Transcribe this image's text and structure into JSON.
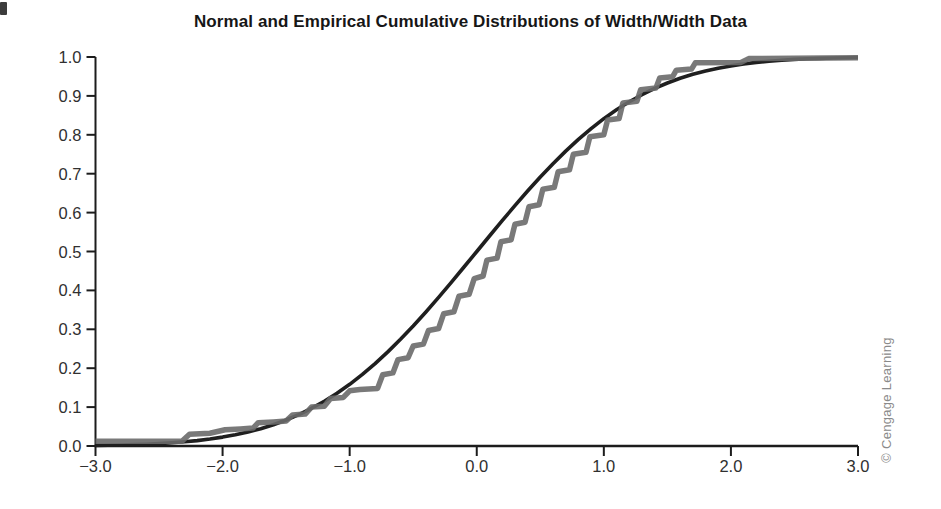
{
  "credit": {
    "text": "© Cengage Learning"
  },
  "colors": {
    "background": "#ffffff",
    "axis": "#1c1c1c",
    "tick_label": "#303030",
    "title": "#161616",
    "credit": "#8a8a8a",
    "normal_curve": "#1f1f1f",
    "empirical_curve": "#6a6a6a"
  },
  "chart_data": {
    "type": "line",
    "title": "Normal and Empirical Cumulative Distributions of Width/Width Data",
    "xlabel": "",
    "ylabel": "",
    "xlim": [
      -3.0,
      3.0
    ],
    "ylim": [
      0.0,
      1.0
    ],
    "grid": false,
    "legend_position": "none",
    "x_ticks": [
      {
        "value": -3.0,
        "label": "−3.0"
      },
      {
        "value": -2.0,
        "label": "−2.0"
      },
      {
        "value": -1.0,
        "label": "−1.0"
      },
      {
        "value": 0.0,
        "label": "0.0"
      },
      {
        "value": 1.0,
        "label": "1.0"
      },
      {
        "value": 2.0,
        "label": "2.0"
      },
      {
        "value": 3.0,
        "label": "3.0"
      }
    ],
    "y_ticks": [
      {
        "value": 0.0,
        "label": "0.0"
      },
      {
        "value": 0.1,
        "label": "0.1"
      },
      {
        "value": 0.2,
        "label": "0.2"
      },
      {
        "value": 0.3,
        "label": "0.3"
      },
      {
        "value": 0.4,
        "label": "0.4"
      },
      {
        "value": 0.5,
        "label": "0.5"
      },
      {
        "value": 0.6,
        "label": "0.6"
      },
      {
        "value": 0.7,
        "label": "0.7"
      },
      {
        "value": 0.8,
        "label": "0.8"
      },
      {
        "value": 0.9,
        "label": "0.9"
      },
      {
        "value": 1.0,
        "label": "1.0"
      }
    ],
    "series": [
      {
        "name": "normal-cdf",
        "label": "Normal cumulative distribution",
        "color": "#1f1f1f",
        "stroke_width": 3.6,
        "points": [
          [
            -3.0,
            0.0013
          ],
          [
            -2.9,
            0.0019
          ],
          [
            -2.8,
            0.0026
          ],
          [
            -2.7,
            0.0035
          ],
          [
            -2.6,
            0.0047
          ],
          [
            -2.5,
            0.0062
          ],
          [
            -2.4,
            0.0082
          ],
          [
            -2.3,
            0.0107
          ],
          [
            -2.2,
            0.0139
          ],
          [
            -2.1,
            0.0179
          ],
          [
            -2.0,
            0.0228
          ],
          [
            -1.9,
            0.0287
          ],
          [
            -1.8,
            0.0359
          ],
          [
            -1.7,
            0.0446
          ],
          [
            -1.6,
            0.0548
          ],
          [
            -1.5,
            0.0668
          ],
          [
            -1.4,
            0.0808
          ],
          [
            -1.3,
            0.0968
          ],
          [
            -1.2,
            0.1151
          ],
          [
            -1.1,
            0.1357
          ],
          [
            -1.0,
            0.1587
          ],
          [
            -0.9,
            0.1841
          ],
          [
            -0.8,
            0.2119
          ],
          [
            -0.7,
            0.242
          ],
          [
            -0.6,
            0.2743
          ],
          [
            -0.5,
            0.3085
          ],
          [
            -0.4,
            0.3446
          ],
          [
            -0.3,
            0.3821
          ],
          [
            -0.2,
            0.4207
          ],
          [
            -0.1,
            0.4602
          ],
          [
            0.0,
            0.5
          ],
          [
            0.1,
            0.5398
          ],
          [
            0.2,
            0.5793
          ],
          [
            0.3,
            0.6179
          ],
          [
            0.4,
            0.6554
          ],
          [
            0.5,
            0.6915
          ],
          [
            0.6,
            0.7257
          ],
          [
            0.7,
            0.758
          ],
          [
            0.8,
            0.7881
          ],
          [
            0.9,
            0.8159
          ],
          [
            1.0,
            0.8413
          ],
          [
            1.1,
            0.8643
          ],
          [
            1.2,
            0.8849
          ],
          [
            1.3,
            0.9032
          ],
          [
            1.4,
            0.9192
          ],
          [
            1.5,
            0.9332
          ],
          [
            1.6,
            0.9452
          ],
          [
            1.7,
            0.9554
          ],
          [
            1.8,
            0.9641
          ],
          [
            1.9,
            0.9713
          ],
          [
            2.0,
            0.9772
          ],
          [
            2.1,
            0.9821
          ],
          [
            2.2,
            0.9861
          ],
          [
            2.3,
            0.9893
          ],
          [
            2.4,
            0.9918
          ],
          [
            2.5,
            0.9938
          ],
          [
            2.6,
            0.9953
          ],
          [
            2.7,
            0.9965
          ],
          [
            2.8,
            0.9974
          ],
          [
            2.9,
            0.9981
          ],
          [
            3.0,
            0.9987
          ]
        ]
      },
      {
        "name": "empirical-cdf",
        "label": "Empirical cumulative distribution",
        "color": "#6a6a6a",
        "stroke_width": 5.5,
        "points": [
          [
            -3.0,
            0.012
          ],
          [
            -2.32,
            0.012
          ],
          [
            -2.26,
            0.03
          ],
          [
            -2.1,
            0.033
          ],
          [
            -1.98,
            0.042
          ],
          [
            -1.86,
            0.044
          ],
          [
            -1.76,
            0.046
          ],
          [
            -1.72,
            0.06
          ],
          [
            -1.6,
            0.062
          ],
          [
            -1.5,
            0.064
          ],
          [
            -1.45,
            0.08
          ],
          [
            -1.35,
            0.082
          ],
          [
            -1.3,
            0.1
          ],
          [
            -1.2,
            0.102
          ],
          [
            -1.15,
            0.122
          ],
          [
            -1.05,
            0.125
          ],
          [
            -1.0,
            0.142
          ],
          [
            -0.92,
            0.145
          ],
          [
            -0.78,
            0.148
          ],
          [
            -0.74,
            0.183
          ],
          [
            -0.66,
            0.188
          ],
          [
            -0.62,
            0.222
          ],
          [
            -0.54,
            0.227
          ],
          [
            -0.5,
            0.257
          ],
          [
            -0.42,
            0.262
          ],
          [
            -0.38,
            0.297
          ],
          [
            -0.3,
            0.302
          ],
          [
            -0.26,
            0.34
          ],
          [
            -0.18,
            0.345
          ],
          [
            -0.14,
            0.385
          ],
          [
            -0.06,
            0.39
          ],
          [
            -0.02,
            0.43
          ],
          [
            0.05,
            0.437
          ],
          [
            0.08,
            0.478
          ],
          [
            0.16,
            0.483
          ],
          [
            0.19,
            0.525
          ],
          [
            0.27,
            0.53
          ],
          [
            0.3,
            0.57
          ],
          [
            0.38,
            0.575
          ],
          [
            0.41,
            0.615
          ],
          [
            0.49,
            0.62
          ],
          [
            0.52,
            0.66
          ],
          [
            0.61,
            0.665
          ],
          [
            0.64,
            0.705
          ],
          [
            0.73,
            0.71
          ],
          [
            0.76,
            0.75
          ],
          [
            0.86,
            0.755
          ],
          [
            0.89,
            0.795
          ],
          [
            1.0,
            0.8
          ],
          [
            1.03,
            0.838
          ],
          [
            1.12,
            0.842
          ],
          [
            1.15,
            0.882
          ],
          [
            1.26,
            0.886
          ],
          [
            1.29,
            0.916
          ],
          [
            1.41,
            0.92
          ],
          [
            1.44,
            0.946
          ],
          [
            1.54,
            0.949
          ],
          [
            1.57,
            0.966
          ],
          [
            1.69,
            0.969
          ],
          [
            1.72,
            0.985
          ],
          [
            2.08,
            0.986
          ],
          [
            2.14,
            0.996
          ],
          [
            3.0,
            0.998
          ]
        ]
      }
    ]
  }
}
